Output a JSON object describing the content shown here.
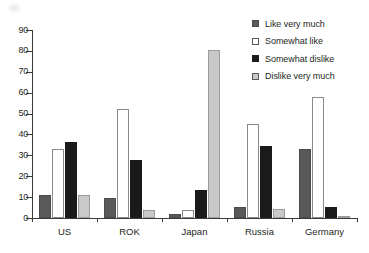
{
  "chart_data": {
    "type": "bar",
    "title": "",
    "xlabel": "",
    "ylabel": "",
    "ylim": [
      0,
      90
    ],
    "ytick_step": 10,
    "yticks": [
      "0",
      "10",
      "20",
      "30",
      "40",
      "50",
      "60",
      "70",
      "80",
      "90"
    ],
    "grid": false,
    "legend_position": "upper right",
    "categories": [
      "US",
      "ROK",
      "Japan",
      "Russia",
      "Germany"
    ],
    "series": [
      {
        "name": "Like very much",
        "color": "#595959",
        "values": [
          11,
          9.5,
          2,
          5.5,
          33
        ]
      },
      {
        "name": "Somewhat like",
        "color": "#ffffff",
        "values": [
          33,
          52,
          4,
          45,
          58
        ]
      },
      {
        "name": "Somewhat dislike",
        "color": "#1a1a1a",
        "values": [
          36.5,
          28,
          13.5,
          34.5,
          5.5
        ]
      },
      {
        "name": "Dislike very much",
        "color": "#c9c9c9",
        "values": [
          11,
          4,
          80.5,
          4.5,
          1
        ]
      }
    ]
  },
  "legend": {
    "items": [
      {
        "label": "Like very much",
        "swatch": "legend-swatch-like-very-much"
      },
      {
        "label": "Somewhat like",
        "swatch": "legend-swatch-somewhat-like"
      },
      {
        "label": "Somewhat dislike",
        "swatch": "legend-swatch-somewhat-dislike"
      },
      {
        "label": "Dislike very much",
        "swatch": "legend-swatch-dislike-very-much"
      }
    ]
  }
}
